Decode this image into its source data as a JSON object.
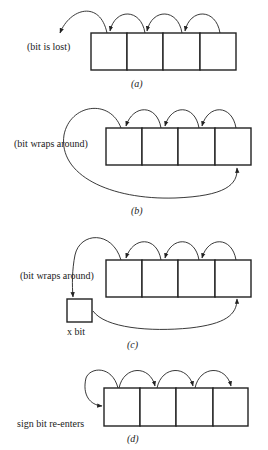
{
  "panels": [
    {
      "id": "a",
      "label": "(bit is lost)",
      "caption": "(a)",
      "cells": 4
    },
    {
      "id": "b",
      "label": "(bit wraps around)",
      "caption": "(b)",
      "cells": 4
    },
    {
      "id": "c",
      "label": "(bit wraps around)",
      "extra_box_label": "x bit",
      "caption": "(c)",
      "cells": 4
    },
    {
      "id": "d",
      "label": "sign bit re-enters",
      "caption": "(d)",
      "cells": 4
    }
  ],
  "captions": {
    "a": "(",
    "a_letter": "a",
    "b_letter": "b",
    "c_letter": "c",
    "d_letter": "d"
  }
}
